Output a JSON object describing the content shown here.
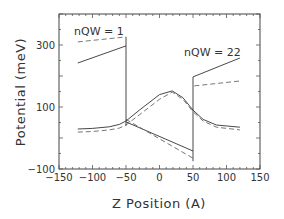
{
  "chart_data": {
    "type": "line",
    "title": "",
    "xlabel": "Z Position (A)",
    "ylabel": "Potential (meV)",
    "xlim": [
      -150,
      150
    ],
    "ylim": [
      -100,
      400
    ],
    "x_ticks": [
      "-150",
      "-100",
      "-50",
      "0",
      "50",
      "100",
      "150"
    ],
    "y_ticks": [
      "-100",
      "100",
      "300"
    ],
    "grid": false,
    "annotations": [
      {
        "text": "nQW  =  1",
        "x": -125,
        "y": 350
      },
      {
        "text": "nQW  =  22",
        "x": 65,
        "y": 265
      }
    ],
    "series": [
      {
        "name": "nQW=1 solid upper",
        "style": "solid",
        "x": [
          -122,
          -50
        ],
        "y": [
          242,
          297
        ]
      },
      {
        "name": "nQW=1 dashed upper",
        "style": "dashed",
        "x": [
          -122,
          -50
        ],
        "y": [
          310,
          326
        ]
      },
      {
        "name": "solid profile",
        "style": "solid",
        "x": [
          -122,
          -100,
          -75,
          -60,
          -50,
          -30,
          0,
          19,
          35,
          50,
          50,
          65,
          85,
          120
        ],
        "y": [
          29,
          31,
          36,
          44,
          55,
          90,
          140,
          152,
          130,
          90,
          90,
          60,
          42,
          35
        ]
      },
      {
        "name": "dashed profile",
        "style": "dashed",
        "x": [
          -122,
          -100,
          -75,
          -60,
          -50,
          -30,
          0,
          19,
          35,
          50,
          50,
          65,
          85,
          120
        ],
        "y": [
          19,
          21,
          26,
          32,
          42,
          75,
          125,
          148,
          125,
          85,
          85,
          55,
          35,
          26
        ]
      },
      {
        "name": "solid linear field",
        "style": "solid",
        "x": [
          -50,
          50
        ],
        "y": [
          52,
          -42
        ]
      },
      {
        "name": "dashed linear field",
        "style": "dashed",
        "x": [
          -50,
          50
        ],
        "y": [
          60,
          -65
        ]
      },
      {
        "name": "nQW=22 solid upper",
        "style": "solid",
        "x": [
          50,
          120
        ],
        "y": [
          197,
          258
        ]
      },
      {
        "name": "nQW=22 dashed upper",
        "style": "dashed",
        "x": [
          52,
          120
        ],
        "y": [
          168,
          184
        ]
      }
    ],
    "verticals": [
      {
        "x": -50,
        "y": [
          40,
          326
        ]
      },
      {
        "x": 50,
        "y": [
          -75,
          197
        ]
      }
    ]
  },
  "labels": {
    "xlabel": "Z Position (A)",
    "ylabel": "Potential (meV)",
    "annot1": "nQW  =  1",
    "annot2": "nQW  =  22"
  }
}
